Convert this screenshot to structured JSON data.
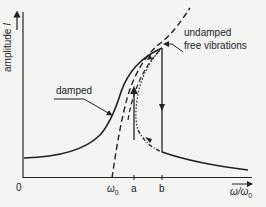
{
  "diagram": {
    "type": "nonlinear resonance curve",
    "axes": {
      "y_label": "amplitude",
      "y_symbol": "I",
      "x_label": "ω/ω",
      "x_label_sub": "0",
      "origin": "0"
    },
    "ticks": [
      {
        "label": "ω",
        "sub": "0"
      },
      {
        "label": "a",
        "sub": ""
      },
      {
        "label": "b",
        "sub": ""
      }
    ],
    "annotations": {
      "damped": "damped",
      "undamped_line1": "undamped",
      "undamped_line2": "free vibrations"
    },
    "colors": {
      "background": "#f4f4f2",
      "ink": "#222222"
    }
  }
}
